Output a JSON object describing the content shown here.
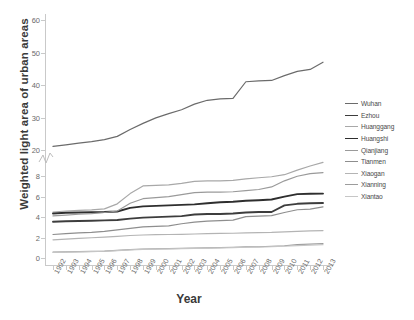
{
  "chart_data": {
    "type": "line",
    "title": "",
    "xlabel": "Year",
    "ylabel": "Weighted light area of urban areas",
    "grid": false,
    "legend_position": "right",
    "broken_axis": true,
    "axis_note": "y-axis broken between 9 and 20",
    "lower_ylim": [
      0,
      9
    ],
    "upper_ylim": [
      20,
      60
    ],
    "lower_yticks": [
      0,
      2,
      4,
      6,
      8
    ],
    "upper_yticks": [
      20,
      30,
      40,
      50,
      60
    ],
    "x": [
      1992,
      1993,
      1994,
      1995,
      1996,
      1997,
      1998,
      1999,
      2000,
      2001,
      2002,
      2003,
      2004,
      2005,
      2006,
      2007,
      2008,
      2009,
      2010,
      2011,
      2012,
      2013
    ],
    "categories": [
      "1992",
      "1993",
      "1994",
      "1995",
      "1996",
      "1997",
      "1998",
      "1999",
      "2000",
      "2001",
      "2002",
      "2003",
      "2004",
      "2005",
      "2006",
      "2007",
      "2008",
      "2009",
      "2010",
      "2011",
      "2012",
      "2013"
    ],
    "series": [
      {
        "name": "Wuhan",
        "color": "#6b6b6b",
        "width": 1.2,
        "panel": "upper",
        "values": [
          21.1,
          21.6,
          22.1,
          22.6,
          23.2,
          24.2,
          26.3,
          28.2,
          29.9,
          31.2,
          32.4,
          34.1,
          35.3,
          35.7,
          35.9,
          41.0,
          41.3,
          41.4,
          42.9,
          44.2,
          44.8,
          47.0
        ]
      },
      {
        "name": "Ezhou",
        "color": "#3d3d3d",
        "width": 1.9,
        "panel": "lower",
        "values": [
          3.55,
          3.6,
          3.62,
          3.65,
          3.68,
          3.72,
          3.85,
          3.95,
          4.0,
          4.05,
          4.1,
          4.25,
          4.3,
          4.3,
          4.35,
          4.45,
          4.5,
          4.5,
          5.15,
          5.3,
          5.35,
          5.38
        ]
      },
      {
        "name": "Huanggang",
        "color": "#a8a8a8",
        "width": 1.2,
        "panel": "lower",
        "values": [
          4.5,
          4.6,
          4.65,
          4.7,
          4.8,
          5.3,
          6.3,
          7.05,
          7.1,
          7.15,
          7.3,
          7.5,
          7.55,
          7.55,
          7.6,
          7.75,
          7.85,
          7.95,
          8.15,
          8.6,
          9.0,
          9.35
        ]
      },
      {
        "name": "Huangshi",
        "color": "#2e2e2e",
        "width": 1.9,
        "panel": "lower",
        "values": [
          4.35,
          4.42,
          4.45,
          4.48,
          4.5,
          4.55,
          4.9,
          5.05,
          5.1,
          5.15,
          5.2,
          5.25,
          5.35,
          5.45,
          5.5,
          5.6,
          5.65,
          5.72,
          6.0,
          6.25,
          6.28,
          6.3
        ]
      },
      {
        "name": "Qianjiang",
        "color": "#9a9a9a",
        "width": 1.2,
        "panel": "lower",
        "values": [
          4.12,
          4.2,
          4.28,
          4.35,
          4.45,
          4.6,
          5.35,
          5.8,
          5.9,
          6.0,
          6.2,
          6.4,
          6.45,
          6.45,
          6.48,
          6.6,
          6.7,
          6.95,
          7.55,
          8.0,
          8.25,
          8.35
        ]
      },
      {
        "name": "Tianmen",
        "color": "#8e8e8e",
        "width": 1.2,
        "panel": "lower",
        "values": [
          2.3,
          2.38,
          2.45,
          2.5,
          2.6,
          2.75,
          2.9,
          3.05,
          3.1,
          3.15,
          3.35,
          3.5,
          3.6,
          3.65,
          3.7,
          4.05,
          4.1,
          4.15,
          4.45,
          4.72,
          4.78,
          5.0
        ]
      },
      {
        "name": "Xiaogan",
        "color": "#b4b4b4",
        "width": 1.2,
        "panel": "lower",
        "values": [
          1.78,
          1.85,
          1.92,
          1.98,
          2.05,
          2.12,
          2.2,
          2.25,
          2.28,
          2.3,
          2.32,
          2.35,
          2.38,
          2.4,
          2.42,
          2.45,
          2.48,
          2.5,
          2.55,
          2.6,
          2.65,
          2.68
        ]
      },
      {
        "name": "Xianning",
        "color": "#9c9c9c",
        "width": 1.2,
        "panel": "lower",
        "values": [
          0.58,
          0.6,
          0.62,
          0.64,
          0.68,
          0.75,
          0.82,
          0.88,
          0.9,
          0.92,
          0.95,
          0.98,
          1.0,
          1.02,
          1.05,
          1.08,
          1.1,
          1.15,
          1.2,
          1.3,
          1.35,
          1.42
        ]
      },
      {
        "name": "Xiantao",
        "color": "#c6c6c6",
        "width": 1.2,
        "panel": "lower",
        "values": [
          0.56,
          0.58,
          0.6,
          0.62,
          0.66,
          0.72,
          0.8,
          0.85,
          0.88,
          0.9,
          0.92,
          0.95,
          0.97,
          1.0,
          1.02,
          1.05,
          1.07,
          1.1,
          1.15,
          1.22,
          1.26,
          1.3
        ]
      }
    ]
  }
}
